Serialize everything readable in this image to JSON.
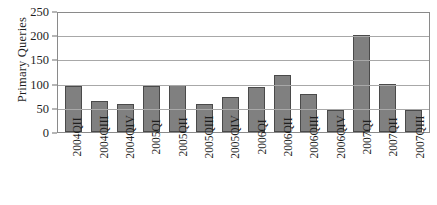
{
  "chart_data": {
    "type": "bar",
    "title": "",
    "xlabel": "",
    "ylabel": "Primary Queries",
    "ylim": [
      0,
      250
    ],
    "ytick_values": [
      250,
      200,
      150,
      100,
      50,
      0
    ],
    "ytick_labels": [
      "250",
      "200",
      "150",
      "100",
      "50",
      "0"
    ],
    "grid": true,
    "legend": "none",
    "categories": [
      "2004QII",
      "2004QIII",
      "2004QIV",
      "2005QI",
      "2005QII",
      "2005QIII",
      "2005QIV",
      "2006QI",
      "2006QII",
      "2006QIII",
      "2006QIV",
      "2007QI",
      "2007QII",
      "2007QIII"
    ],
    "values": [
      95,
      65,
      58,
      96,
      98,
      57,
      72,
      93,
      117,
      79,
      46,
      200,
      100,
      45
    ],
    "bar_fill_color": "#808080",
    "bar_edge_color": "#4a4a4a",
    "gridline_color": "#a8a8a8",
    "frame_color": "#8a8a8a"
  }
}
